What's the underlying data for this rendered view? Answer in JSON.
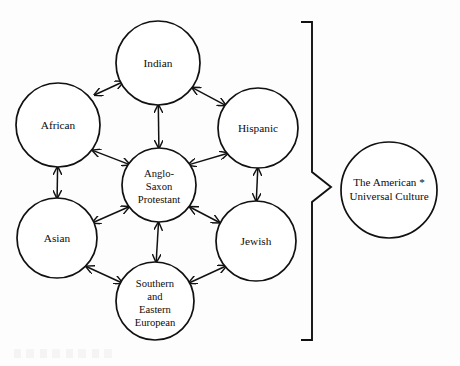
{
  "figure": {
    "type": "concept-diagram",
    "background_color": "#fdfdfd",
    "stroke_color": "#111111"
  },
  "nodes": [
    {
      "id": "indian",
      "label": "Indian",
      "lines": [
        "Indian"
      ],
      "cx": 158,
      "cy": 63,
      "r": 42,
      "role": "satellite"
    },
    {
      "id": "african",
      "label": "African",
      "lines": [
        "African"
      ],
      "cx": 58,
      "cy": 125,
      "r": 42,
      "role": "satellite"
    },
    {
      "id": "hispanic",
      "label": "Hispanic",
      "lines": [
        "Hispanic"
      ],
      "cx": 258,
      "cy": 128,
      "r": 40,
      "role": "satellite"
    },
    {
      "id": "asian",
      "label": "Asian",
      "lines": [
        "Asian"
      ],
      "cx": 57,
      "cy": 238,
      "r": 40,
      "role": "satellite"
    },
    {
      "id": "jewish",
      "label": "Jewish",
      "lines": [
        "Jewish"
      ],
      "cx": 256,
      "cy": 241,
      "r": 40,
      "role": "satellite"
    },
    {
      "id": "southern-eastern-european",
      "label": "Southern and Eastern European",
      "lines": [
        "Southern",
        "and",
        "Eastern",
        "European"
      ],
      "cx": 155,
      "cy": 301,
      "r": 39,
      "role": "satellite"
    },
    {
      "id": "anglo-saxon-protestant",
      "label": "Anglo-Saxon Protestant",
      "lines": [
        "Anglo-",
        "Saxon",
        "Protestant"
      ],
      "cx": 159,
      "cy": 185,
      "r": 37,
      "role": "core"
    },
    {
      "id": "american-universal-culture",
      "label": "The American * Universal Culture",
      "lines": [
        "The American *",
        "Universal Culture"
      ],
      "cx": 389,
      "cy": 190,
      "r": 48,
      "role": "outcome"
    }
  ],
  "links": [
    {
      "from": "african",
      "to": "indian",
      "style": "double-arrow"
    },
    {
      "from": "indian",
      "to": "hispanic",
      "style": "double-arrow"
    },
    {
      "from": "indian",
      "to": "anglo-saxon-protestant",
      "style": "double-arrow"
    },
    {
      "from": "african",
      "to": "anglo-saxon-protestant",
      "style": "double-arrow"
    },
    {
      "from": "hispanic",
      "to": "anglo-saxon-protestant",
      "style": "double-arrow"
    },
    {
      "from": "african",
      "to": "asian",
      "style": "double-arrow"
    },
    {
      "from": "hispanic",
      "to": "jewish",
      "style": "double-arrow"
    },
    {
      "from": "asian",
      "to": "anglo-saxon-protestant",
      "style": "double-arrow"
    },
    {
      "from": "jewish",
      "to": "anglo-saxon-protestant",
      "style": "double-arrow"
    },
    {
      "from": "anglo-saxon-protestant",
      "to": "southern-eastern-european",
      "style": "double-arrow"
    },
    {
      "from": "asian",
      "to": "southern-eastern-european",
      "style": "double-arrow"
    },
    {
      "from": "jewish",
      "to": "southern-eastern-european",
      "style": "double-arrow"
    }
  ],
  "bracket": {
    "name": "grouping-bracket",
    "orientation": "right-pointing",
    "top_y": 22,
    "bottom_y": 340,
    "spine_x": 312,
    "tip_x": 331,
    "tip_y": 187,
    "arm_length": 11
  },
  "labels": {
    "indian": "Indian",
    "african": "African",
    "hispanic": "Hispanic",
    "asian": "Asian",
    "jewish": "Jewish",
    "se_european_l1": "Southern",
    "se_european_l2": "and",
    "se_european_l3": "Eastern",
    "se_european_l4": "European",
    "core_l1": "Anglo-",
    "core_l2": "Saxon",
    "core_l3": "Protestant",
    "outcome_l1": "The American *",
    "outcome_l2": "Universal Culture"
  }
}
